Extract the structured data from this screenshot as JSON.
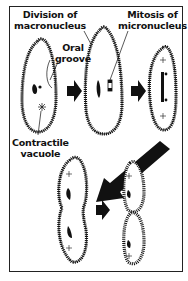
{
  "diagram": {
    "labels": {
      "division_macronucleus_1": "Division of",
      "division_macronucleus_2": "macronucleus",
      "oral_groove_1": "Oral",
      "oral_groove_2": "groove",
      "mitosis_1": "Mitosis of",
      "mitosis_2": "micronucleus",
      "contractile_1": "Contractile",
      "contractile_2": "vacuole"
    },
    "stages": [
      {
        "id": 1,
        "description": "Paramecium with macronucleus, oral groove and contractile vacuole"
      },
      {
        "id": 2,
        "description": "Elongating cell, macronucleus dividing, micronucleus mitosis"
      },
      {
        "id": 3,
        "description": "Nuclei separated toward poles"
      },
      {
        "id": 4,
        "description": "Cell constricting in middle"
      },
      {
        "id": 5,
        "description": "Two daughter cells separating"
      }
    ],
    "arrows": [
      "stage1-to-2",
      "stage2-to-3",
      "stage3-to-4",
      "stage4-to-5"
    ],
    "colors": {
      "ink": "#111111",
      "background": "#ffffff"
    }
  }
}
